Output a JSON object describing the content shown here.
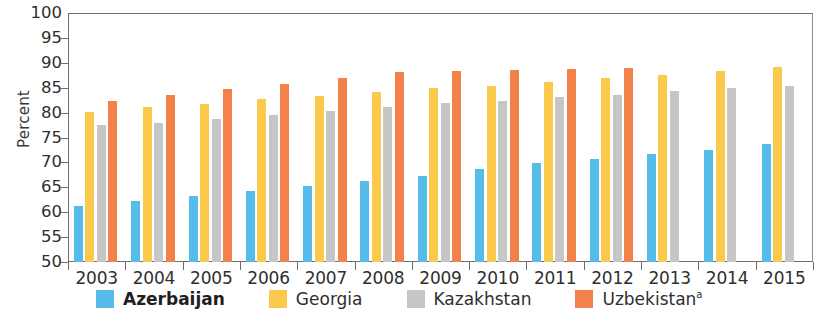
{
  "chart_data": {
    "type": "bar",
    "title": "",
    "xlabel": "",
    "ylabel": "Percent",
    "ylim": [
      50,
      100
    ],
    "ytick_step": 5,
    "yticks": [
      100,
      95,
      90,
      85,
      80,
      75,
      70,
      65,
      60,
      55,
      50
    ],
    "grid": false,
    "legend_position": "bottom",
    "categories": [
      "2003",
      "2004",
      "2005",
      "2006",
      "2007",
      "2008",
      "2009",
      "2010",
      "2011",
      "2012",
      "2013",
      "2014",
      "2015"
    ],
    "series": [
      {
        "name": "Azerbaijan",
        "color": "#56bdeb",
        "bold_legend": true,
        "values": [
          61.3,
          62.3,
          63.2,
          64.3,
          65.3,
          66.3,
          67.3,
          68.6,
          69.8,
          70.6,
          71.6,
          72.5,
          73.6
        ]
      },
      {
        "name": "Georgia",
        "color": "#fbca4d",
        "bold_legend": false,
        "values": [
          80.1,
          81.1,
          81.8,
          82.7,
          83.3,
          84.1,
          84.9,
          85.4,
          86.2,
          86.9,
          87.5,
          88.4,
          89.1
        ]
      },
      {
        "name": "Kazakhstan",
        "color": "#c6c6c6",
        "bold_legend": false,
        "values": [
          77.5,
          78.0,
          78.7,
          79.5,
          80.3,
          81.2,
          81.9,
          82.4,
          83.2,
          83.6,
          84.4,
          84.9,
          85.4
        ]
      },
      {
        "name": "Uzbekistan",
        "superscript": "a",
        "color": "#f28249",
        "bold_legend": false,
        "values": [
          82.4,
          83.5,
          84.7,
          85.8,
          86.9,
          88.2,
          88.4,
          88.5,
          88.7,
          88.9,
          null,
          null,
          null
        ]
      }
    ]
  },
  "legend": {
    "items": [
      {
        "label": "Azerbaijan",
        "key": "azerbaijan",
        "bold": true,
        "superscript": ""
      },
      {
        "label": "Georgia",
        "key": "georgia",
        "bold": false,
        "superscript": ""
      },
      {
        "label": "Kazakhstan",
        "key": "kazakhstan",
        "bold": false,
        "superscript": ""
      },
      {
        "label": "Uzbekistan",
        "key": "uzbekistan",
        "bold": false,
        "superscript": "a"
      }
    ]
  }
}
